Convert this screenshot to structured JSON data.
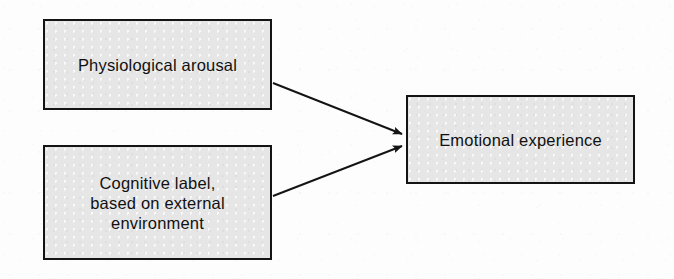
{
  "diagram": {
    "type": "flow",
    "background_color": "#fdfdfd",
    "node_fill_color": "#e6e6e6",
    "node_border_color": "#141414",
    "arrow_color": "#141414",
    "nodes": [
      {
        "id": "arousal",
        "label": "Physiological arousal",
        "x": 43,
        "y": 19,
        "width": 229,
        "height": 91,
        "lines": 1
      },
      {
        "id": "cognitive",
        "label": "Cognitive label,\nbased on external\nenvironment",
        "x": 43,
        "y": 145,
        "width": 229,
        "height": 115,
        "lines": 3
      },
      {
        "id": "emotion",
        "label": "Emotional experience",
        "x": 406,
        "y": 95,
        "width": 229,
        "height": 89,
        "lines": 1
      }
    ],
    "edges": [
      {
        "id": "arousal-to-emotion",
        "from": "arousal",
        "to": "emotion",
        "x1": 273,
        "y1": 83,
        "x2": 404,
        "y2": 134,
        "arrowhead": "filled-triangle"
      },
      {
        "id": "cognitive-to-emotion",
        "from": "cognitive",
        "to": "emotion",
        "x1": 273,
        "y1": 196,
        "x2": 404,
        "y2": 146,
        "arrowhead": "filled-triangle"
      }
    ]
  }
}
